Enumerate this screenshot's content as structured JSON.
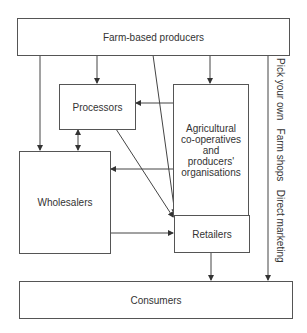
{
  "diagram": {
    "nodes": {
      "farm": {
        "label": "Farm-based producers"
      },
      "processors": {
        "label": "Processors"
      },
      "agri": {
        "label": "Agricultural co-operatives and producers' organisations",
        "lines": [
          "Agricultural",
          "co-operatives",
          "and",
          "producers'",
          "organisations"
        ]
      },
      "wholesalers": {
        "label": "Wholesalers"
      },
      "retailers": {
        "label": "Retailers"
      },
      "consumers": {
        "label": "Consumers"
      }
    },
    "direct_channel_label": "Pick your own   Farm shops   Direct marketing",
    "edges": [
      {
        "from": "Farm-based producers",
        "to": "Processors"
      },
      {
        "from": "Farm-based producers",
        "to": "Agricultural co-operatives and producers' organisations"
      },
      {
        "from": "Farm-based producers",
        "to": "Wholesalers"
      },
      {
        "from": "Farm-based producers",
        "to": "Retailers"
      },
      {
        "from": "Farm-based producers",
        "to": "Consumers",
        "label": "Pick your own / Farm shops / Direct marketing"
      },
      {
        "from": "Agricultural co-operatives and producers' organisations",
        "to": "Processors"
      },
      {
        "from": "Agricultural co-operatives and producers' organisations",
        "to": "Wholesalers"
      },
      {
        "from": "Agricultural co-operatives and producers' organisations",
        "to": "Retailers"
      },
      {
        "from": "Processors",
        "to": "Wholesalers",
        "bidirectional": true
      },
      {
        "from": "Processors",
        "to": "Retailers"
      },
      {
        "from": "Wholesalers",
        "to": "Retailers"
      },
      {
        "from": "Retailers",
        "to": "Consumers"
      }
    ]
  }
}
